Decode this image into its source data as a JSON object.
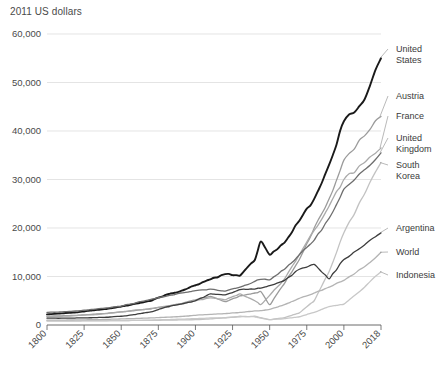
{
  "chart_data": {
    "type": "line",
    "title": "2011 US dollars",
    "xlabel": "",
    "ylabel": "",
    "xlim": [
      1800,
      2018
    ],
    "ylim": [
      0,
      60000
    ],
    "grid": true,
    "legend_position": "right-inline-labels",
    "ytick_labels": [
      "0",
      "10,000",
      "20,000",
      "30,000",
      "40,000",
      "50,000",
      "60,000"
    ],
    "ytick_values": [
      0,
      10000,
      20000,
      30000,
      40000,
      50000,
      60000
    ],
    "xtick_labels": [
      "1800",
      "1825",
      "1850",
      "1875",
      "1900",
      "1925",
      "1950",
      "1975",
      "2000",
      "2018"
    ],
    "xtick_values": [
      1800,
      1825,
      1850,
      1875,
      1900,
      1925,
      1950,
      1975,
      2000,
      2018
    ],
    "x": [
      1800,
      1810,
      1820,
      1830,
      1840,
      1850,
      1860,
      1870,
      1880,
      1890,
      1900,
      1910,
      1920,
      1930,
      1940,
      1944,
      1950,
      1960,
      1970,
      1980,
      1990,
      2000,
      2010,
      2018
    ],
    "series": [
      {
        "name": "United States",
        "color": "#1a1a1a",
        "width": 1.9,
        "label_x": 396,
        "label_y": 52,
        "values": [
          2200,
          2400,
          2600,
          3000,
          3300,
          3800,
          4400,
          5000,
          6200,
          7000,
          8200,
          9400,
          10500,
          10200,
          13400,
          17200,
          14500,
          17000,
          21500,
          26000,
          33000,
          42000,
          46500,
          55000
        ]
      },
      {
        "name": "Austria",
        "color": "#9b9b9b",
        "width": 1.3,
        "label_x": 396,
        "label_y": 99,
        "values": [
          1800,
          1900,
          2000,
          2200,
          2400,
          2700,
          3000,
          3400,
          3800,
          4400,
          5200,
          5900,
          4800,
          6000,
          6600,
          6900,
          4200,
          8600,
          13500,
          20000,
          26000,
          34000,
          39000,
          43000
        ]
      },
      {
        "name": "France",
        "color": "#aaaaaa",
        "width": 1.3,
        "label_x": 396,
        "label_y": 119,
        "values": [
          1700,
          1800,
          1950,
          2100,
          2350,
          2700,
          3100,
          3300,
          3900,
          4300,
          5000,
          5600,
          5200,
          6400,
          5000,
          4200,
          6100,
          9500,
          14500,
          19500,
          24500,
          30000,
          33500,
          36500
        ]
      },
      {
        "name": "United Kingdom",
        "color": "#6e6e6e",
        "width": 1.3,
        "label_x": 396,
        "label_y": 141,
        "values": [
          2600,
          2700,
          2900,
          3200,
          3500,
          3900,
          4600,
          5300,
          5900,
          6600,
          7100,
          7400,
          7000,
          7800,
          9000,
          9400,
          9300,
          11500,
          14500,
          17500,
          22000,
          28000,
          32000,
          35500
        ]
      },
      {
        "name": "South Korea",
        "color": "#c2c2c2",
        "width": 1.3,
        "label_x": 396,
        "label_y": 168,
        "values": [
          900,
          900,
          900,
          900,
          900,
          900,
          950,
          950,
          1000,
          1050,
          1100,
          1250,
          1500,
          1700,
          1800,
          1500,
          1100,
          1500,
          2500,
          5000,
          11000,
          19000,
          27000,
          33500
        ]
      },
      {
        "name": "Argentina",
        "color": "#3d3d3d",
        "width": 1.3,
        "label_x": 396,
        "label_y": 231,
        "values": [
          1400,
          1400,
          1450,
          1500,
          1600,
          1800,
          2200,
          2700,
          3700,
          4300,
          5000,
          6400,
          6200,
          7300,
          7400,
          7600,
          8100,
          9200,
          11500,
          12500,
          9500,
          13500,
          16500,
          19000
        ]
      },
      {
        "name": "World",
        "color": "#b4b4b4",
        "width": 1.3,
        "label_x": 396,
        "label_y": 255,
        "values": [
          1000,
          1020,
          1050,
          1080,
          1150,
          1250,
          1350,
          1450,
          1600,
          1750,
          2000,
          2200,
          2350,
          2600,
          2900,
          2950,
          3200,
          4200,
          5500,
          6600,
          7800,
          9200,
          12000,
          15000
        ]
      },
      {
        "name": "Indonesia",
        "color": "#c8c8c8",
        "width": 1.3,
        "label_x": 396,
        "label_y": 278,
        "values": [
          800,
          800,
          820,
          850,
          880,
          900,
          950,
          1000,
          1100,
          1200,
          1300,
          1450,
          1500,
          1800,
          1700,
          1400,
          1100,
          1300,
          1700,
          2600,
          3800,
          4300,
          7800,
          11000
        ]
      }
    ]
  }
}
